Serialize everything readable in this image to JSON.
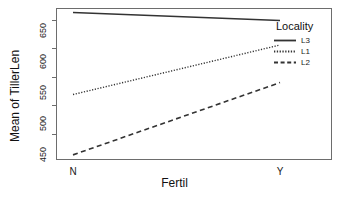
{
  "chart_data": {
    "type": "line",
    "title": "",
    "xlabel": "Fertil",
    "ylabel": "Mean of TillerLen",
    "categories": [
      "N",
      "Y"
    ],
    "xticks": [
      "N",
      "Y"
    ],
    "yticks": [
      "450",
      "500",
      "550",
      "600",
      "650"
    ],
    "ylim": [
      405,
      672
    ],
    "xlim": [
      0,
      1
    ],
    "grid": false,
    "legend": {
      "position": "right-top",
      "title": "Locality",
      "entries": [
        {
          "name": "L3",
          "linestyle": "solid",
          "color": "#333333"
        },
        {
          "name": "L1",
          "linestyle": "dotted",
          "color": "#333333"
        },
        {
          "name": "L2",
          "linestyle": "dashed",
          "color": "#333333"
        }
      ]
    },
    "series": [
      {
        "name": "L3",
        "linestyle": "solid",
        "color": "#333333",
        "values": [
          664,
          650
        ]
      },
      {
        "name": "L1",
        "linestyle": "dotted",
        "color": "#333333",
        "values": [
          520,
          607
        ]
      },
      {
        "name": "L2",
        "linestyle": "dashed",
        "color": "#333333",
        "values": [
          414,
          541
        ]
      }
    ]
  },
  "axes": {
    "y_title": "Mean of TillerLen",
    "x_title": "Fertil",
    "y_tick_labels": [
      "650",
      "600",
      "550",
      "500",
      "450"
    ],
    "x_tick_labels": [
      "N",
      "Y"
    ]
  },
  "legend": {
    "title": "Locality",
    "items": [
      {
        "label": "L3"
      },
      {
        "label": "L1"
      },
      {
        "label": "L2"
      }
    ]
  },
  "colors": {
    "line": "#333333",
    "frame": "#6d6d6d",
    "text": "#1a1a1a",
    "background": "#ffffff"
  }
}
